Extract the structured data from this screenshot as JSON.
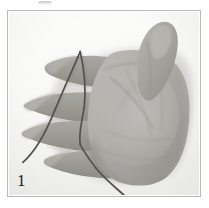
{
  "figure": {
    "number_label": "1",
    "caption": "",
    "kind": "photograph",
    "frame": {
      "border_color": "#b9b9b9",
      "background_color": "#fdfdfd"
    }
  },
  "photo": {
    "alt_text": "Grayscale photo of a left hand held palm-up with fingers spread apart; a thin dark string passes over the index finger, loops around the middle finger and trails off the lower-left and bottom edges of the frame.",
    "palette": {
      "background": "#f6f6f4",
      "skin_light": "#c9c7c2",
      "skin_mid": "#a3a19c",
      "skin_shadow": "#8a8883",
      "skin_deep_shadow": "#6f6d69",
      "crease": "#7b7975",
      "string": "#4a4845",
      "page_white": "#ffffff",
      "number_ink": "#1d1d1d"
    },
    "elements": [
      {
        "name": "background",
        "label": "plain light backdrop"
      },
      {
        "name": "palm",
        "label": "palm of hand"
      },
      {
        "name": "thumb",
        "label": "thumb, raised upper right"
      },
      {
        "name": "index-finger",
        "label": "index finger"
      },
      {
        "name": "middle-finger",
        "label": "middle finger"
      },
      {
        "name": "ring-finger",
        "label": "ring finger"
      },
      {
        "name": "little-finger",
        "label": "little finger"
      },
      {
        "name": "string-upper",
        "label": "string segment crossing the index finger to lower left"
      },
      {
        "name": "string-loop",
        "label": "string loop around the middle finger"
      },
      {
        "name": "string-lower",
        "label": "string segment trailing off the bottom edge"
      }
    ]
  },
  "top_artifact": {
    "name": "scan-smudge",
    "label": "faint scanning smudge above the frame"
  }
}
